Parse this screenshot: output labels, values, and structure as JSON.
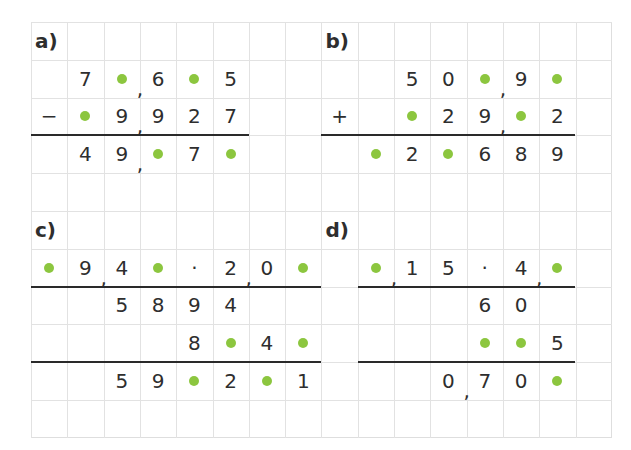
{
  "grid": {
    "cols": 16,
    "rows": 11,
    "cell_w": 36.3,
    "cell_h": 37.8,
    "line_color": "#e2e2e2"
  },
  "colors": {
    "blank_dot": "#8cc63f",
    "text": "#2e2e2e",
    "rule": "#2a2a2a"
  },
  "exercises": [
    {
      "label": "a)",
      "label_pos": [
        0,
        0
      ],
      "operation": "subtraction",
      "cells": [
        {
          "r": 1,
          "c": 1,
          "v": "7"
        },
        {
          "r": 1,
          "c": 2,
          "v": "•"
        },
        {
          "r": 1,
          "c": 3,
          "v": "6"
        },
        {
          "r": 1,
          "c": 4,
          "v": "•"
        },
        {
          "r": 1,
          "c": 5,
          "v": "5"
        },
        {
          "r": 2,
          "c": 0,
          "v": "−"
        },
        {
          "r": 2,
          "c": 1,
          "v": "•"
        },
        {
          "r": 2,
          "c": 2,
          "v": "9"
        },
        {
          "r": 2,
          "c": 3,
          "v": "9"
        },
        {
          "r": 2,
          "c": 4,
          "v": "2"
        },
        {
          "r": 2,
          "c": 5,
          "v": "7"
        },
        {
          "r": 3,
          "c": 1,
          "v": "4"
        },
        {
          "r": 3,
          "c": 2,
          "v": "9"
        },
        {
          "r": 3,
          "c": 3,
          "v": "•"
        },
        {
          "r": 3,
          "c": 4,
          "v": "7"
        },
        {
          "r": 3,
          "c": 5,
          "v": "•"
        }
      ],
      "commas": [
        {
          "r": 1,
          "c": 3
        },
        {
          "r": 2,
          "c": 3
        },
        {
          "r": 3,
          "c": 3
        }
      ],
      "rules": [
        {
          "r": 3,
          "c0": 0,
          "c1": 6
        }
      ]
    },
    {
      "label": "b)",
      "label_pos": [
        0,
        8
      ],
      "operation": "addition",
      "cells": [
        {
          "r": 1,
          "c": 10,
          "v": "5"
        },
        {
          "r": 1,
          "c": 11,
          "v": "0"
        },
        {
          "r": 1,
          "c": 12,
          "v": "•"
        },
        {
          "r": 1,
          "c": 13,
          "v": "9"
        },
        {
          "r": 1,
          "c": 14,
          "v": "•"
        },
        {
          "r": 2,
          "c": 8,
          "v": "+"
        },
        {
          "r": 2,
          "c": 10,
          "v": "•"
        },
        {
          "r": 2,
          "c": 11,
          "v": "2"
        },
        {
          "r": 2,
          "c": 12,
          "v": "9"
        },
        {
          "r": 2,
          "c": 13,
          "v": "•"
        },
        {
          "r": 2,
          "c": 14,
          "v": "2"
        },
        {
          "r": 3,
          "c": 9,
          "v": "•"
        },
        {
          "r": 3,
          "c": 10,
          "v": "2"
        },
        {
          "r": 3,
          "c": 11,
          "v": "•"
        },
        {
          "r": 3,
          "c": 12,
          "v": "6"
        },
        {
          "r": 3,
          "c": 13,
          "v": "8"
        },
        {
          "r": 3,
          "c": 14,
          "v": "9"
        }
      ],
      "commas": [
        {
          "r": 1,
          "c": 13
        },
        {
          "r": 2,
          "c": 13
        }
      ],
      "rules": [
        {
          "r": 3,
          "c0": 8,
          "c1": 15
        }
      ]
    },
    {
      "label": "c)",
      "label_pos": [
        5,
        0
      ],
      "operation": "multiplication",
      "cells": [
        {
          "r": 6,
          "c": 0,
          "v": "•"
        },
        {
          "r": 6,
          "c": 1,
          "v": "9"
        },
        {
          "r": 6,
          "c": 2,
          "v": "4"
        },
        {
          "r": 6,
          "c": 3,
          "v": "•"
        },
        {
          "r": 6,
          "c": 4,
          "v": "·"
        },
        {
          "r": 6,
          "c": 5,
          "v": "2"
        },
        {
          "r": 6,
          "c": 6,
          "v": "0"
        },
        {
          "r": 6,
          "c": 7,
          "v": "•"
        },
        {
          "r": 7,
          "c": 2,
          "v": "5"
        },
        {
          "r": 7,
          "c": 3,
          "v": "8"
        },
        {
          "r": 7,
          "c": 4,
          "v": "9"
        },
        {
          "r": 7,
          "c": 5,
          "v": "4"
        },
        {
          "r": 8,
          "c": 4,
          "v": "8"
        },
        {
          "r": 8,
          "c": 5,
          "v": "•"
        },
        {
          "r": 8,
          "c": 6,
          "v": "4"
        },
        {
          "r": 8,
          "c": 7,
          "v": "•"
        },
        {
          "r": 9,
          "c": 2,
          "v": "5"
        },
        {
          "r": 9,
          "c": 3,
          "v": "9"
        },
        {
          "r": 9,
          "c": 4,
          "v": "•"
        },
        {
          "r": 9,
          "c": 5,
          "v": "2"
        },
        {
          "r": 9,
          "c": 6,
          "v": "•"
        },
        {
          "r": 9,
          "c": 7,
          "v": "1"
        }
      ],
      "commas": [
        {
          "r": 6,
          "c": 2
        },
        {
          "r": 6,
          "c": 6
        }
      ],
      "rules": [
        {
          "r": 7,
          "c0": 0,
          "c1": 8
        },
        {
          "r": 9,
          "c0": 0,
          "c1": 8
        }
      ]
    },
    {
      "label": "d)",
      "label_pos": [
        5,
        8
      ],
      "operation": "multiplication",
      "cells": [
        {
          "r": 6,
          "c": 9,
          "v": "•"
        },
        {
          "r": 6,
          "c": 10,
          "v": "1"
        },
        {
          "r": 6,
          "c": 11,
          "v": "5"
        },
        {
          "r": 6,
          "c": 12,
          "v": "·"
        },
        {
          "r": 6,
          "c": 13,
          "v": "4"
        },
        {
          "r": 6,
          "c": 14,
          "v": "•"
        },
        {
          "r": 7,
          "c": 12,
          "v": "6"
        },
        {
          "r": 7,
          "c": 13,
          "v": "0"
        },
        {
          "r": 8,
          "c": 12,
          "v": "•"
        },
        {
          "r": 8,
          "c": 13,
          "v": "•"
        },
        {
          "r": 8,
          "c": 14,
          "v": "5"
        },
        {
          "r": 9,
          "c": 11,
          "v": "0"
        },
        {
          "r": 9,
          "c": 12,
          "v": "7"
        },
        {
          "r": 9,
          "c": 13,
          "v": "0"
        },
        {
          "r": 9,
          "c": 14,
          "v": "•"
        }
      ],
      "commas": [
        {
          "r": 6,
          "c": 10
        },
        {
          "r": 6,
          "c": 14
        },
        {
          "r": 9,
          "c": 12
        }
      ],
      "rules": [
        {
          "r": 7,
          "c0": 9,
          "c1": 15
        },
        {
          "r": 9,
          "c0": 9,
          "c1": 15
        }
      ]
    }
  ]
}
